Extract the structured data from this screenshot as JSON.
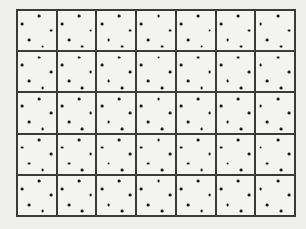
{
  "figure": {
    "colors": {
      "page_background": "#eeeeec",
      "cell_background": "#f3f3f1",
      "grid_line": "#3a3a3a",
      "dot": "#1c1c1c"
    },
    "grid": {
      "rows": 5,
      "columns": 7,
      "cell_count": 35
    },
    "dots_per_cell": 5,
    "dot_motif_percent": [
      {
        "x": 57,
        "y": 14
      },
      {
        "x": 11.5,
        "y": 33
      },
      {
        "x": 87,
        "y": 50
      },
      {
        "x": 29.5,
        "y": 74
      },
      {
        "x": 65.5,
        "y": 91
      }
    ]
  }
}
